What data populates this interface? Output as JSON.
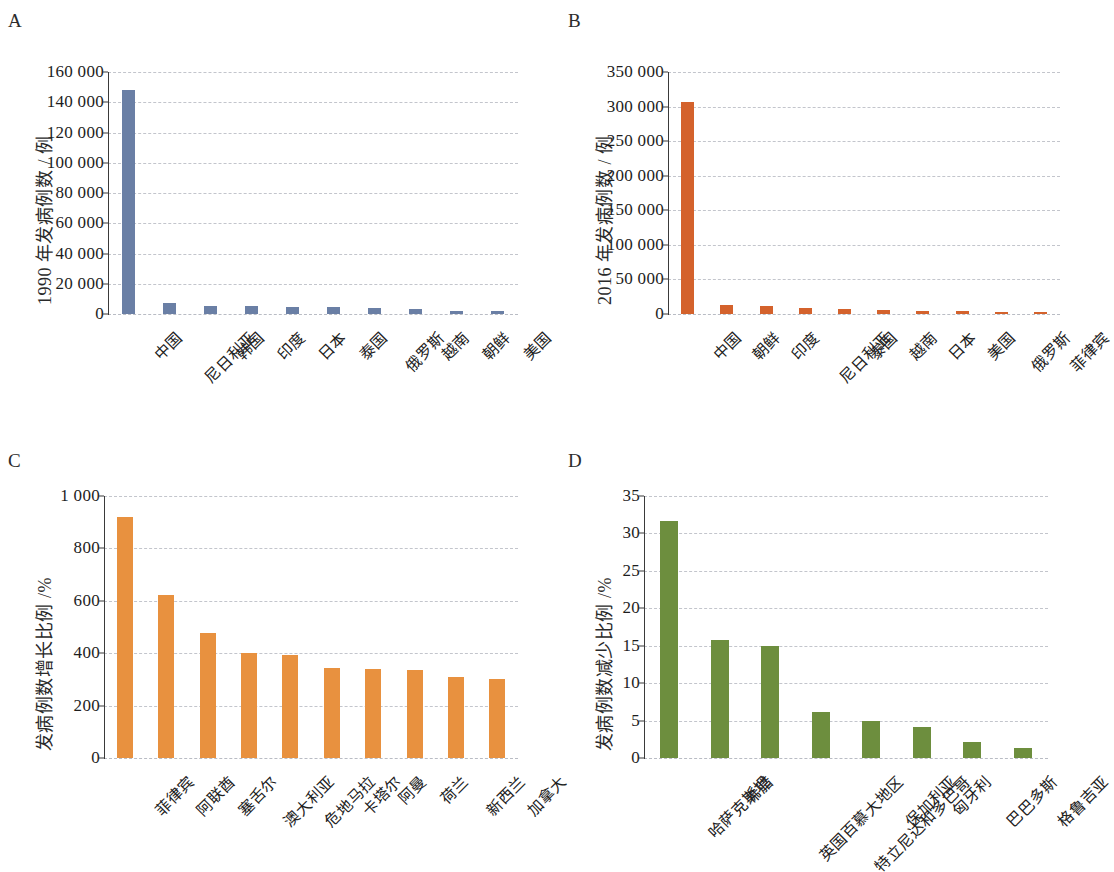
{
  "figure": {
    "panels": [
      "A",
      "B",
      "C",
      "D"
    ]
  },
  "chart_data": [
    {
      "panel": "A",
      "type": "bar",
      "title": "",
      "xlabel": "",
      "ylabel": "1990 年发病例数 / 例",
      "ylim": [
        0,
        160000
      ],
      "ytick_labels": [
        "0",
        "20 000",
        "40 000",
        "60 000",
        "80 000",
        "100 000",
        "120 000",
        "140 000",
        "160 000"
      ],
      "ytick_values": [
        0,
        20000,
        40000,
        60000,
        80000,
        100000,
        120000,
        140000,
        160000
      ],
      "grid": true,
      "legend": "none",
      "color": "#6a7fa5",
      "categories": [
        "中国",
        "尼日利亚",
        "韩国",
        "印度",
        "日本",
        "泰国",
        "俄罗斯",
        "越南",
        "朝鲜",
        "美国"
      ],
      "values": [
        148000,
        7600,
        5400,
        5000,
        4800,
        4500,
        3900,
        3200,
        2100,
        1800
      ]
    },
    {
      "panel": "B",
      "type": "bar",
      "title": "",
      "xlabel": "",
      "ylabel": "2016 年发病例数 / 例",
      "ylim": [
        0,
        350000
      ],
      "ytick_labels": [
        "0",
        "50 000",
        "100 000",
        "150 000",
        "200 000",
        "250 000",
        "300 000",
        "350 000"
      ],
      "ytick_values": [
        0,
        50000,
        100000,
        150000,
        200000,
        250000,
        300000,
        350000
      ],
      "grid": true,
      "legend": "none",
      "color": "#d4622c",
      "categories": [
        "中国",
        "朝鲜",
        "印度",
        "尼日利亚",
        "泰国",
        "越南",
        "日本",
        "美国",
        "俄罗斯",
        "菲律宾"
      ],
      "values": [
        307000,
        13000,
        11500,
        9000,
        7500,
        6000,
        5000,
        4000,
        3000,
        2800
      ]
    },
    {
      "panel": "C",
      "type": "bar",
      "title": "",
      "xlabel": "",
      "ylabel": "发病例数增长比例 /%",
      "ylim": [
        0,
        1000
      ],
      "ytick_labels": [
        "0",
        "200",
        "400",
        "600",
        "800",
        "1 000"
      ],
      "ytick_values": [
        0,
        200,
        400,
        600,
        800,
        1000
      ],
      "grid": true,
      "legend": "none",
      "color": "#e8913f",
      "categories": [
        "菲律宾",
        "阿联酋",
        "塞舌尔",
        "澳大利亚",
        "危地马拉",
        "卡塔尔",
        "阿曼",
        "荷兰",
        "新西兰",
        "加拿大"
      ],
      "values": [
        920,
        622,
        478,
        400,
        392,
        343,
        338,
        335,
        310,
        300
      ]
    },
    {
      "panel": "D",
      "type": "bar",
      "title": "",
      "xlabel": "",
      "ylabel": "发病例数减少比例 /%",
      "ylim": [
        0,
        35
      ],
      "ytick_labels": [
        "0",
        "5",
        "10",
        "15",
        "20",
        "25",
        "30",
        "35"
      ],
      "ytick_values": [
        0,
        5,
        10,
        15,
        20,
        25,
        30,
        35
      ],
      "grid": true,
      "legend": "none",
      "color": "#6d8e3e",
      "categories": [
        "哈萨克斯坦",
        "希腊",
        "英国百慕大地区",
        "特立尼达和多巴哥",
        "保加利亚",
        "匈牙利",
        "巴巴多斯",
        "格鲁吉亚"
      ],
      "values": [
        31.7,
        15.8,
        14.9,
        6.2,
        4.9,
        4.1,
        2.2,
        1.4
      ]
    }
  ]
}
